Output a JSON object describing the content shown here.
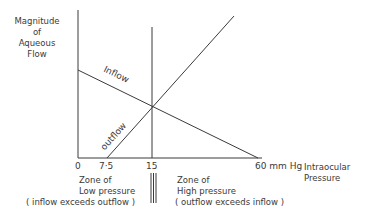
{
  "diagram": {
    "y_axis_label": [
      "Magnitude",
      "of",
      "Aqueous",
      "Flow"
    ],
    "x_axis_label": [
      "Intraocular",
      "Pressure"
    ],
    "x_ticks": [
      "0",
      "7·5",
      "15",
      "60 mm Hg"
    ],
    "curves": {
      "inflow": "Inflow",
      "outflow": "outflow"
    },
    "zones": {
      "low": [
        "Zone of",
        "Low pressure",
        "( inflow exceeds outflow )"
      ],
      "high": [
        "Zone of",
        "High pressure",
        "( outflow exceeds inflow )"
      ]
    },
    "line_color": "#3a3a3a"
  }
}
